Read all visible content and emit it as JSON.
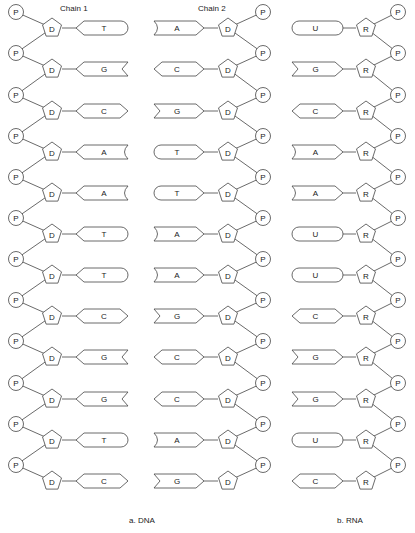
{
  "headings": {
    "chain1": "Chain 1",
    "chain2": "Chain 2"
  },
  "captions": {
    "dna": "a. DNA",
    "rna": "b. RNA"
  },
  "nodes": {
    "phosphate": "P",
    "deoxyribose": "D",
    "ribose": "R"
  },
  "dna": {
    "chain1_bases": [
      "T",
      "G",
      "C",
      "A",
      "A",
      "T",
      "T",
      "C",
      "G",
      "G",
      "T",
      "C"
    ],
    "chain2_bases": [
      "A",
      "C",
      "G",
      "T",
      "T",
      "A",
      "A",
      "G",
      "C",
      "C",
      "A",
      "G"
    ]
  },
  "rna": {
    "bases": [
      "U",
      "G",
      "C",
      "A",
      "A",
      "U",
      "U",
      "C",
      "G",
      "G",
      "U",
      "C"
    ]
  },
  "colors": {
    "stroke": "#444444",
    "text": "#222222",
    "background": "#ffffff"
  }
}
